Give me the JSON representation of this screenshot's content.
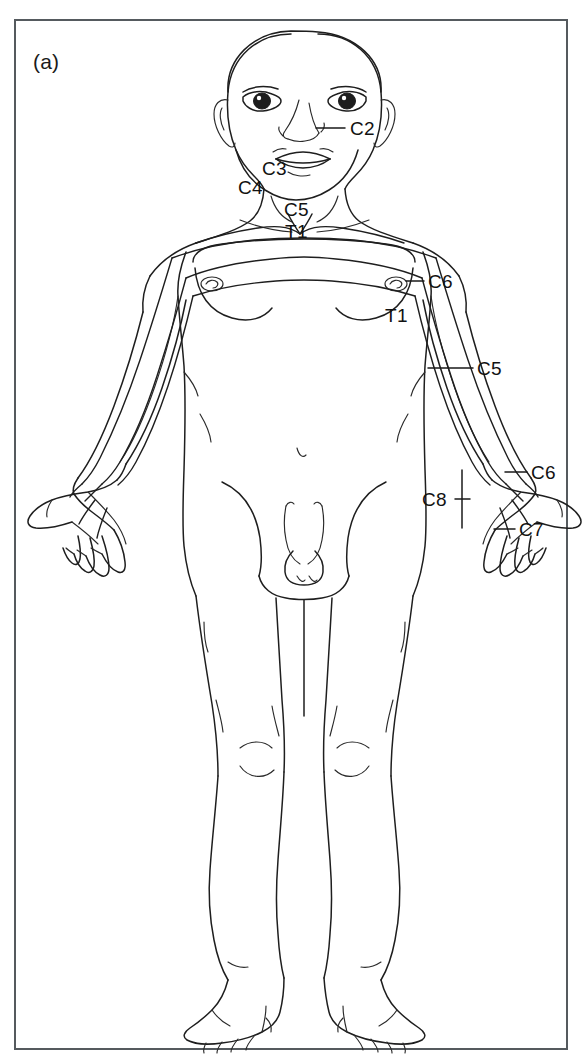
{
  "figure": {
    "panel_label": "(a)",
    "view": "anterior",
    "border_color": "#555a5e",
    "ink_color": "#1e1e1e",
    "background_color": "#ffffff"
  },
  "labels": [
    {
      "id": "c2",
      "text": "C2",
      "x": 350,
      "y": 119,
      "leader": true,
      "leader_type": "line",
      "lx1": 316,
      "ly1": 128,
      "lx2": 345,
      "ly2": 128
    },
    {
      "id": "c3",
      "text": "C3",
      "x": 262,
      "y": 159,
      "leader": false,
      "leader_type": "none",
      "lx1": 0,
      "ly1": 0,
      "lx2": 0,
      "ly2": 0
    },
    {
      "id": "c4",
      "text": "C4",
      "x": 238,
      "y": 178,
      "leader": false,
      "leader_type": "none",
      "lx1": 0,
      "ly1": 0,
      "lx2": 0,
      "ly2": 0
    },
    {
      "id": "c5-neck",
      "text": "C5",
      "x": 284,
      "y": 200,
      "leader": false,
      "leader_type": "none",
      "lx1": 0,
      "ly1": 0,
      "lx2": 0,
      "ly2": 0
    },
    {
      "id": "t1-neck",
      "text": "T1",
      "x": 285,
      "y": 222,
      "leader": false,
      "leader_type": "none",
      "lx1": 0,
      "ly1": 0,
      "lx2": 0,
      "ly2": 0
    },
    {
      "id": "c6-arm",
      "text": "C6",
      "x": 428,
      "y": 272,
      "leader": true,
      "leader_type": "line",
      "lx1": 406,
      "ly1": 281,
      "lx2": 424,
      "ly2": 281
    },
    {
      "id": "t1-arm",
      "text": "T1",
      "x": 385,
      "y": 306,
      "leader": false,
      "leader_type": "none",
      "lx1": 0,
      "ly1": 0,
      "lx2": 0,
      "ly2": 0
    },
    {
      "id": "c5-arm",
      "text": "C5",
      "x": 477,
      "y": 359,
      "leader": true,
      "leader_type": "line",
      "lx1": 428,
      "ly1": 368,
      "lx2": 473,
      "ly2": 368
    },
    {
      "id": "c6-hand",
      "text": "C6",
      "x": 531,
      "y": 463,
      "leader": true,
      "leader_type": "line",
      "lx1": 505,
      "ly1": 472,
      "lx2": 527,
      "ly2": 472
    },
    {
      "id": "c8-hand",
      "text": "C8",
      "x": 422,
      "y": 490,
      "leader": true,
      "leader_type": "bracket",
      "lx1": 455,
      "ly1": 499,
      "lx2": 462,
      "ly2": 499
    },
    {
      "id": "c7-hand",
      "text": "C7",
      "x": 519,
      "y": 520,
      "leader": true,
      "leader_type": "line",
      "lx1": 494,
      "ly1": 529,
      "lx2": 515,
      "ly2": 529
    }
  ],
  "dermatomes": [
    "C2",
    "C3",
    "C4",
    "C5",
    "C6",
    "C7",
    "C8",
    "T1"
  ]
}
